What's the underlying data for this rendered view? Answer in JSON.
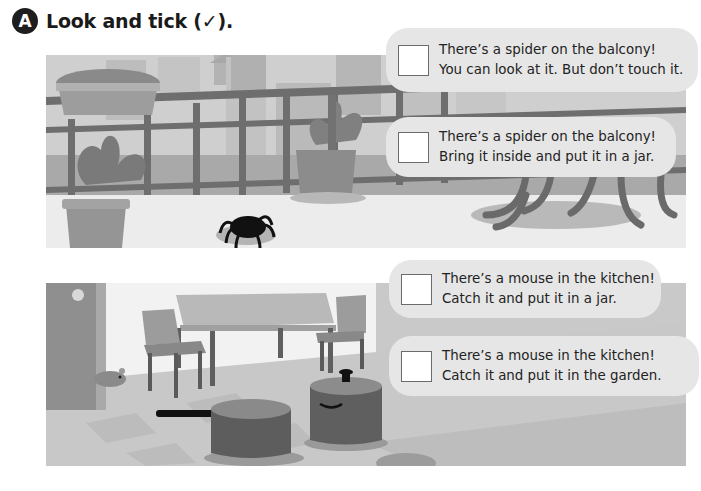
{
  "exercise": {
    "badge": "A",
    "instruction": "Look and tick (✓)."
  },
  "scenes": [
    {
      "name": "balcony",
      "elements": [
        "city-buildings",
        "railing",
        "flower-box",
        "potted-plant-left",
        "potted-plant-right",
        "spider",
        "table-legs"
      ],
      "options": [
        {
          "line1": "There’s a spider on the balcony!",
          "line2": "You can look at it. But don’t touch it.",
          "checked": false
        },
        {
          "line1": "There’s a spider on the balcony!",
          "line2": "Bring it inside and put it in a jar.",
          "checked": false
        }
      ]
    },
    {
      "name": "kitchen",
      "elements": [
        "door",
        "mouse",
        "table",
        "chairs",
        "checkered-floor",
        "saucepan",
        "cooking-pot",
        "counter"
      ],
      "options": [
        {
          "line1": "There’s a mouse in the kitchen!",
          "line2": "Catch it and put it in a jar.",
          "checked": false
        },
        {
          "line1": "There’s a mouse in the kitchen!",
          "line2": "Catch it and put it in the garden.",
          "checked": false
        }
      ]
    }
  ],
  "colors": {
    "bubble": "#e6e6e6",
    "tickbox_border": "#6b6b6b",
    "badge": "#1e1e1e"
  }
}
